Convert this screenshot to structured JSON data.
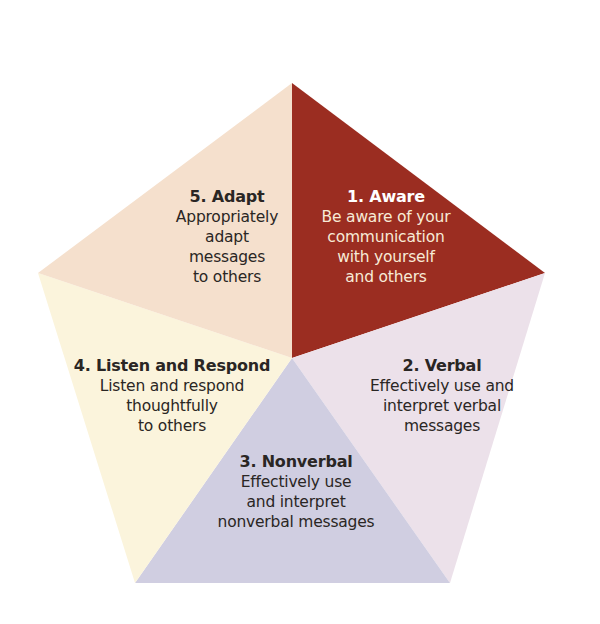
{
  "diagram": {
    "type": "pentagon-segments",
    "center": [
      292,
      358
    ],
    "vertices": {
      "top": [
        292,
        83
      ],
      "right": [
        545,
        273
      ],
      "bottom_right": [
        450,
        583
      ],
      "bottom_left": [
        135,
        583
      ],
      "left": [
        38,
        273
      ]
    },
    "segments": [
      {
        "id": "aware",
        "title": "1. Aware",
        "description": "Be aware of your\ncommunication\nwith yourself\nand others",
        "color": "#9b2d21"
      },
      {
        "id": "verbal",
        "title": "2. Verbal",
        "description": "Effectively use and\ninterpret verbal\nmessages",
        "color": "#ece1ea"
      },
      {
        "id": "nonverbal",
        "title": "3. Nonverbal",
        "description": "Effectively use\nand interpret\nnonverbal messages",
        "color": "#d0cee1"
      },
      {
        "id": "listen",
        "title": "4. Listen and Respond",
        "description": "Listen and respond\nthoughtfully\nto others",
        "color": "#fbf4dc"
      },
      {
        "id": "adapt",
        "title": "5. Adapt",
        "description": "Appropriately\nadapt\nmessages\nto others",
        "color": "#f5e0cd"
      }
    ]
  }
}
